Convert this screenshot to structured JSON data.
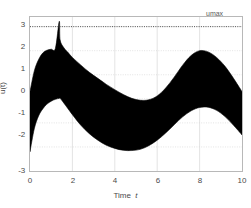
{
  "figure": {
    "background_color": "#ffffff",
    "axes_color": "#b8b8b8",
    "grid_color": "#d7d7d7",
    "band_color": "#000000",
    "text_color": "#4a4a4a"
  },
  "labels": {
    "xlabel_prefix": "Time",
    "xlabel_var": "t",
    "ylabel": "u(t)",
    "umax_annotation": "umax"
  },
  "ticks": {
    "x": [
      "0",
      "2",
      "4",
      "6",
      "8",
      "10"
    ],
    "y": [
      "3",
      "2",
      "1",
      "0",
      "-1",
      "-2",
      "-3"
    ]
  },
  "chart_data": {
    "type": "area",
    "title": "",
    "xlabel": "Time t",
    "ylabel": "u(t)",
    "xlim": [
      0,
      10
    ],
    "ylim": [
      -3,
      3.4
    ],
    "xticks": [
      0,
      2,
      4,
      6,
      8,
      10
    ],
    "yticks": [
      -3,
      -2,
      -1,
      0,
      1,
      2,
      3
    ],
    "grid": true,
    "legend": null,
    "annotations": [
      {
        "text": "umax",
        "type": "constraint-line",
        "y": 3,
        "style": "dotted",
        "label_x": 9.2,
        "label_y": 3.3
      }
    ],
    "series": [
      {
        "name": "upper bound",
        "x": [
          0.0,
          0.2,
          0.4,
          0.6,
          0.8,
          1.0,
          1.2,
          1.38,
          1.42,
          1.6,
          1.8,
          2.0,
          2.4,
          2.8,
          3.2,
          3.6,
          4.0,
          4.4,
          4.8,
          5.2,
          5.6,
          6.0,
          6.4,
          6.8,
          7.2,
          7.6,
          8.0,
          8.4,
          8.8,
          9.2,
          9.6,
          10.0
        ],
        "values": [
          0.3,
          1.15,
          1.62,
          1.9,
          2.02,
          2.06,
          2.1,
          3.22,
          2.45,
          2.12,
          1.92,
          1.72,
          1.4,
          1.1,
          0.85,
          0.6,
          0.38,
          0.18,
          0.02,
          -0.06,
          -0.04,
          0.12,
          0.45,
          0.9,
          1.4,
          1.8,
          2.0,
          1.95,
          1.72,
          1.35,
          0.85,
          0.3
        ]
      },
      {
        "name": "lower bound",
        "x": [
          0.0,
          0.2,
          0.4,
          0.6,
          0.8,
          1.0,
          1.2,
          1.38,
          1.42,
          1.6,
          1.8,
          2.0,
          2.4,
          2.8,
          3.2,
          3.6,
          4.0,
          4.4,
          4.8,
          5.2,
          5.6,
          6.0,
          6.4,
          6.8,
          7.2,
          7.6,
          8.0,
          8.4,
          8.8,
          9.2,
          9.6,
          10.0
        ],
        "values": [
          -2.2,
          -1.25,
          -0.72,
          -0.42,
          -0.22,
          -0.1,
          -0.02,
          0.02,
          0.02,
          -0.18,
          -0.42,
          -0.66,
          -1.1,
          -1.45,
          -1.72,
          -1.93,
          -2.06,
          -2.14,
          -2.15,
          -2.1,
          -1.95,
          -1.72,
          -1.42,
          -1.08,
          -0.75,
          -0.5,
          -0.36,
          -0.35,
          -0.48,
          -0.74,
          -1.1,
          -1.5
        ]
      }
    ]
  }
}
